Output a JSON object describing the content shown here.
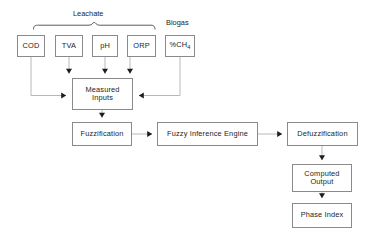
{
  "diagram": {
    "background_color": "#ffffff",
    "border_color": "#8a8a8a",
    "text_color": "#1d1d1d",
    "connector_color": "#b0b0b0",
    "arrowhead_color": "#1d1d1d",
    "group_labels": [
      {
        "id": "leachate",
        "text": "Leachate"
      },
      {
        "id": "biogas",
        "text": "Biogas"
      }
    ],
    "sensor_inputs": [
      {
        "id": "cod",
        "label": "COD",
        "group": "Leachate"
      },
      {
        "id": "tva",
        "label": "TVA",
        "group": "Leachate"
      },
      {
        "id": "ph",
        "label": "pH",
        "group": "Leachate"
      },
      {
        "id": "orp",
        "label": "ORP",
        "group": "Leachate"
      },
      {
        "id": "ch4",
        "label_prefix": "%CH",
        "label_subscript": "4",
        "group": "Biogas"
      }
    ],
    "process_nodes": [
      {
        "id": "measured-inputs",
        "line1": "Measured",
        "line2": "Inputs"
      },
      {
        "id": "fuzzification",
        "label": "Fuzzification"
      },
      {
        "id": "fuzzy-inference-engine",
        "label": "Fuzzy Inference Engine"
      },
      {
        "id": "defuzzification",
        "label": "Defuzzification"
      },
      {
        "id": "computed-output",
        "line1": "Computed",
        "line2": "Output"
      },
      {
        "id": "phase-index",
        "label": "Phase Index"
      }
    ],
    "connections": [
      {
        "from": "COD",
        "to": "Measured Inputs"
      },
      {
        "from": "TVA",
        "to": "Measured Inputs"
      },
      {
        "from": "pH",
        "to": "Measured Inputs"
      },
      {
        "from": "ORP",
        "to": "Measured Inputs"
      },
      {
        "from": "%CH4",
        "to": "Measured Inputs"
      },
      {
        "from": "Measured Inputs",
        "to": "Fuzzification"
      },
      {
        "from": "Fuzzification",
        "to": "Fuzzy Inference Engine"
      },
      {
        "from": "Fuzzy Inference Engine",
        "to": "Defuzzification"
      },
      {
        "from": "Defuzzification",
        "to": "Computed Output"
      },
      {
        "from": "Computed Output",
        "to": "Phase Index"
      }
    ]
  }
}
